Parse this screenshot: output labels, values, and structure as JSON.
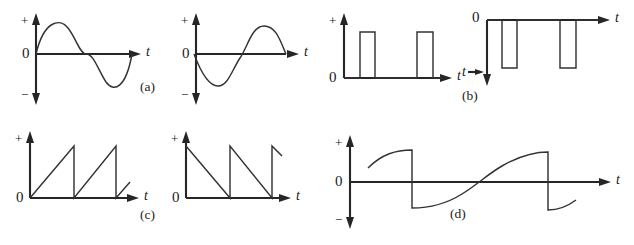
{
  "figure": {
    "background_color": "#ffffff",
    "line_color": "#333333",
    "axis_color": "#262626",
    "axis_labels": {
      "plus": "+",
      "minus": "−",
      "zero": "0",
      "time": "t"
    },
    "panels": [
      {
        "id": "a",
        "caption": "(a)",
        "waveforms": [
          {
            "name": "sine-positive-first",
            "type": "sine",
            "description": "one full sine cycle starting positive",
            "cycles": 1,
            "start_phase_deg": 0,
            "polarity_first_half": "positive"
          },
          {
            "name": "sine-negative-first",
            "type": "sine",
            "description": "one full sine cycle starting negative (inverted)",
            "cycles": 1,
            "start_phase_deg": 180,
            "polarity_first_half": "negative"
          }
        ]
      },
      {
        "id": "b",
        "caption": "(b)",
        "waveforms": [
          {
            "name": "pulse-train-positive",
            "type": "rectangular-pulse",
            "description": "two narrow positive rectangular pulses above baseline",
            "pulse_count": 2,
            "direction": "up"
          },
          {
            "name": "pulse-train-negative",
            "type": "rectangular-pulse",
            "description": "two narrow negative rectangular pulses below baseline, vertical axis points down",
            "pulse_count": 2,
            "direction": "down"
          }
        ]
      },
      {
        "id": "c",
        "caption": "(c)",
        "waveforms": [
          {
            "name": "sawtooth-rising",
            "type": "sawtooth",
            "description": "rising ramp then sharp vertical fall",
            "ramp": "rising",
            "cycles": 2.3
          },
          {
            "name": "sawtooth-falling",
            "type": "sawtooth",
            "description": "sharp vertical rise then falling ramp",
            "ramp": "falling",
            "cycles": 2.3
          }
        ]
      },
      {
        "id": "d",
        "caption": "(d)",
        "waveforms": [
          {
            "name": "distorted-sawtooth-sine",
            "type": "distorted-sawtooth",
            "description": "curved rising ramp peaking then dropping vertically through zero to a negative value, repeating",
            "cycles": 2,
            "bipolar": true
          }
        ]
      }
    ]
  }
}
